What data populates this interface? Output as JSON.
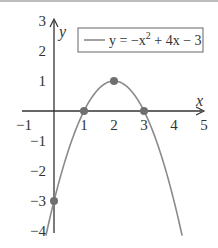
{
  "chart_data": {
    "type": "line",
    "title": "",
    "xlabel": "x",
    "ylabel": "y",
    "xlim": [
      -1,
      5
    ],
    "ylim": [
      -4,
      3
    ],
    "grid": false,
    "legend_position": "top-right",
    "x_ticks": [
      "−1",
      "1",
      "2",
      "3",
      "4",
      "5"
    ],
    "y_ticks": [
      "3",
      "2",
      "1",
      "−1",
      "−2",
      "−3",
      "−4"
    ],
    "series": [
      {
        "name": "y = −x² + 4x − 3",
        "function": "-x^2 + 4x - 3",
        "x_range": [
          -0.27,
          4.27
        ],
        "color": "#8a8a8a"
      }
    ],
    "highlighted_points": [
      {
        "x": 0,
        "y": -3
      },
      {
        "x": 1,
        "y": 0
      },
      {
        "x": 2,
        "y": 1
      },
      {
        "x": 3,
        "y": 0
      }
    ],
    "point_color": "#6f6f6f",
    "axis_color": "#333333"
  },
  "legend": {
    "prefix": "y = −x",
    "sup": "2",
    "suffix": " + 4x − 3"
  },
  "labels": {
    "x_axis": "x",
    "y_axis": "y"
  }
}
